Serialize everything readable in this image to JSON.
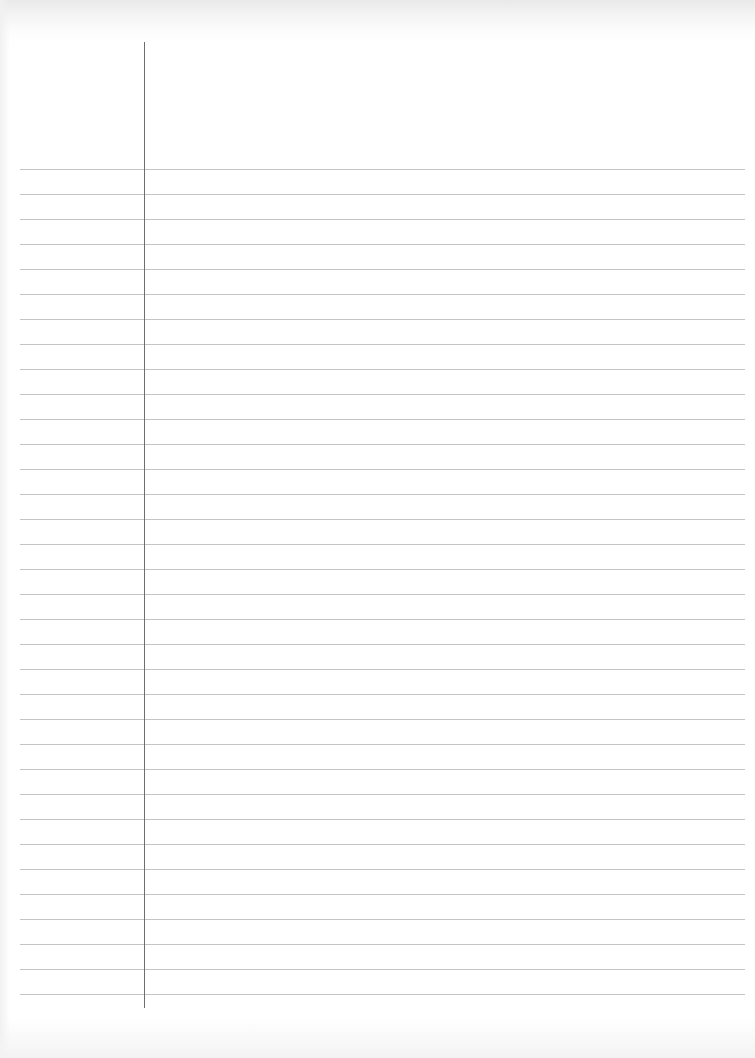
{
  "page": {
    "type": "lined-paper",
    "content_text": "",
    "colors": {
      "paper": "#ffffff",
      "rule_line": "#c4c4c4",
      "margin_line": "#6e6e6e",
      "top_edge_shade": "#e9e9e9"
    },
    "rules": {
      "count": 34,
      "first_y": 169,
      "spacing": 25,
      "left_x": 20,
      "right_x": 745
    },
    "margin": {
      "x": 144,
      "top_y": 42,
      "bottom_y": 1008
    }
  }
}
